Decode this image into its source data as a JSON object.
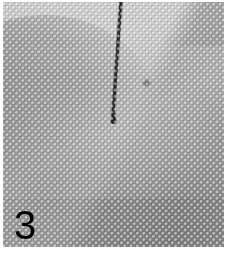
{
  "figure": {
    "panel_label": "3",
    "kind": "halftone-printed grayscale micrograph",
    "caption_text": "",
    "annotations": [
      {
        "name": "needle-probe-line",
        "description": "thin dark near-vertical line descending from the top edge to a small blunt tip",
        "start_x": 121,
        "start_y": 0,
        "end_x": 112,
        "end_y": 121,
        "color": "#1a1a1a"
      }
    ],
    "regions": [
      {
        "name": "bright-notch-top-centre",
        "tone": "#ffffff"
      },
      {
        "name": "grey-lobe-upper-left",
        "tone": "#a8a8a8"
      },
      {
        "name": "dark-mass-right",
        "tone": "#9a9a9a"
      },
      {
        "name": "light-diagonal-band-middle",
        "tone": "#dedede"
      },
      {
        "name": "lower-field",
        "tone": "#c3c3c3"
      }
    ],
    "colors": {
      "paper": "#ffffff",
      "ink": "#000000",
      "plate_light": "#f4f4f4",
      "plate_mid": "#c9c9c9",
      "plate_dark": "#8e8e8e",
      "label": "#000000"
    },
    "plate": {
      "left": 3,
      "top": 2,
      "width": 221,
      "height": 245
    }
  }
}
